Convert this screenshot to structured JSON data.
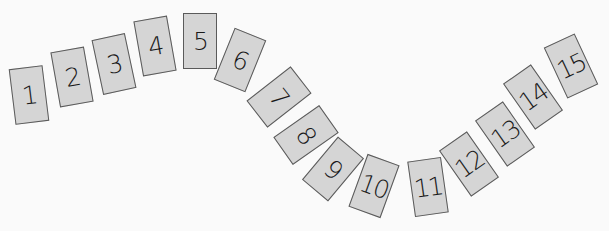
{
  "cards": [
    {
      "label": "1"
    },
    {
      "label": "2"
    },
    {
      "label": "3"
    },
    {
      "label": "4"
    },
    {
      "label": "5"
    },
    {
      "label": "6"
    },
    {
      "label": "7"
    },
    {
      "label": "8"
    },
    {
      "label": "9"
    },
    {
      "label": "10"
    },
    {
      "label": "11"
    },
    {
      "label": "12"
    },
    {
      "label": "13"
    },
    {
      "label": "14"
    },
    {
      "label": "15"
    }
  ],
  "colors": {
    "background": "#fafafa",
    "card_fill": "#d5d5d5",
    "card_border": "#5a5a5a",
    "text": "#1a1a1a"
  }
}
